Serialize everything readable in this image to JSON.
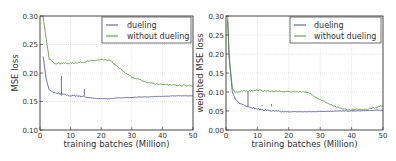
{
  "colors": {
    "dueling": "#4b4a8f",
    "without_dueling": "#5a8a3a",
    "grid": "#c8c8c8",
    "axis": "#222222"
  },
  "chart_data": [
    {
      "type": "line",
      "title": "",
      "xlabel": "training batches (Million)",
      "ylabel": "MSE loss",
      "xlim": [
        0,
        50
      ],
      "ylim": [
        0.1,
        0.3
      ],
      "xticks": [
        "0",
        "10",
        "20",
        "30",
        "40",
        "50"
      ],
      "yticks": [
        "0.10",
        "0.15",
        "0.20",
        "0.25",
        "0.30"
      ],
      "grid": true,
      "legend_position": "upper right",
      "x": [
        1,
        2,
        3,
        4,
        5,
        7,
        10,
        12,
        15,
        18,
        20,
        23,
        25,
        28,
        30,
        33,
        35,
        40,
        45,
        50
      ],
      "series": [
        {
          "name": "dueling",
          "values": [
            0.23,
            0.19,
            0.17,
            0.167,
            0.165,
            0.163,
            0.16,
            0.16,
            0.158,
            0.155,
            0.155,
            0.155,
            0.156,
            0.157,
            0.157,
            0.158,
            0.158,
            0.159,
            0.16,
            0.16
          ]
        },
        {
          "name": "without dueling",
          "values": [
            0.3,
            0.26,
            0.225,
            0.22,
            0.217,
            0.217,
            0.217,
            0.218,
            0.22,
            0.222,
            0.223,
            0.222,
            0.212,
            0.2,
            0.193,
            0.188,
            0.183,
            0.18,
            0.178,
            0.178
          ]
        }
      ]
    },
    {
      "type": "line",
      "title": "",
      "xlabel": "training batches (Million)",
      "ylabel": "weighted MSE loss",
      "xlim": [
        0,
        50
      ],
      "ylim": [
        0.0,
        0.3
      ],
      "xticks": [
        "0",
        "10",
        "20",
        "30",
        "40",
        "50"
      ],
      "yticks": [
        "0.00",
        "0.05",
        "0.10",
        "0.15",
        "0.20",
        "0.25",
        "0.30"
      ],
      "grid": true,
      "legend_position": "upper right",
      "x": [
        0.5,
        1,
        2,
        3,
        4,
        5,
        7,
        10,
        12,
        15,
        18,
        20,
        23,
        25,
        27,
        30,
        33,
        35,
        38,
        40,
        45,
        48,
        50
      ],
      "series": [
        {
          "name": "dueling",
          "values": [
            0.29,
            0.19,
            0.1,
            0.08,
            0.072,
            0.068,
            0.062,
            0.055,
            0.053,
            0.05,
            0.048,
            0.048,
            0.048,
            0.048,
            0.048,
            0.049,
            0.049,
            0.05,
            0.05,
            0.05,
            0.051,
            0.052,
            0.052
          ]
        },
        {
          "name": "without dueling",
          "values": [
            0.3,
            0.2,
            0.11,
            0.1,
            0.1,
            0.102,
            0.103,
            0.105,
            0.103,
            0.102,
            0.101,
            0.101,
            0.101,
            0.101,
            0.095,
            0.08,
            0.068,
            0.06,
            0.054,
            0.053,
            0.055,
            0.06,
            0.064
          ]
        }
      ]
    }
  ],
  "charts": [
    {
      "ylabel": "MSE loss",
      "xlabel": "training batches (Million)",
      "legend": [
        "dueling",
        "without dueling"
      ]
    },
    {
      "ylabel": "weighted MSE loss",
      "xlabel": "training batches (Million)",
      "legend": [
        "dueling",
        "without dueling"
      ]
    }
  ]
}
